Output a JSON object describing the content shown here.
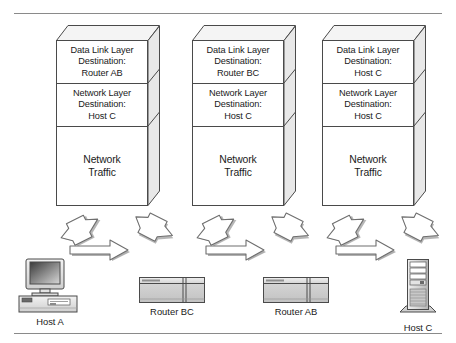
{
  "diagram": {
    "rules": {
      "top": true,
      "bottom": true
    },
    "colors": {
      "line": "#4a4a4a",
      "rule": "#8a8a8a",
      "text": "#1a1a1a",
      "arrow_fill": "#ffffff",
      "arrow_stroke": "#6e6e6e",
      "arrow_shadow": "#6e6e6e",
      "device_fill": "#d9d9d9",
      "face_fill": "#ffffff",
      "side_fill": "#e6e6e6",
      "top_fill": "#f2f2f2"
    },
    "stacks": [
      {
        "id": "stack-1",
        "data_link_layer": {
          "layer": "Data Link Layer",
          "destination_label": "Destination:",
          "destination_value": "Router AB"
        },
        "network_layer": {
          "layer": "Network Layer",
          "destination_label": "Destination:",
          "destination_value": "Host C"
        },
        "payload": {
          "line1": "Network",
          "line2": "Traffic"
        }
      },
      {
        "id": "stack-2",
        "data_link_layer": {
          "layer": "Data Link Layer",
          "destination_label": "Destination:",
          "destination_value": "Router BC"
        },
        "network_layer": {
          "layer": "Network Layer",
          "destination_label": "Destination:",
          "destination_value": "Host C"
        },
        "payload": {
          "line1": "Network",
          "line2": "Traffic"
        }
      },
      {
        "id": "stack-3",
        "data_link_layer": {
          "layer": "Data Link Layer",
          "destination_label": "Destination:",
          "destination_value": "Host C"
        },
        "network_layer": {
          "layer": "Network Layer",
          "destination_label": "Destination:",
          "destination_value": "Host C"
        },
        "payload": {
          "line1": "Network",
          "line2": "Traffic"
        }
      }
    ],
    "devices": [
      {
        "id": "host-a",
        "label": "Host A",
        "icon": "desktop-computer-icon"
      },
      {
        "id": "router-bc",
        "label": "Router BC",
        "icon": "router-icon"
      },
      {
        "id": "router-ab",
        "label": "Router AB",
        "icon": "router-icon"
      },
      {
        "id": "host-c",
        "label": "Host C",
        "icon": "tower-server-icon"
      }
    ],
    "arrow_groups": [
      {
        "id": "group-1",
        "up": "arrow-up-right-icon",
        "down": "arrow-down-right-icon",
        "across": "arrow-right-icon"
      },
      {
        "id": "group-2",
        "up": "arrow-up-right-icon",
        "down": "arrow-down-right-icon",
        "across": "arrow-right-icon"
      },
      {
        "id": "group-3",
        "up": "arrow-up-right-icon",
        "down": "arrow-down-right-icon",
        "across": "arrow-right-icon"
      }
    ]
  }
}
